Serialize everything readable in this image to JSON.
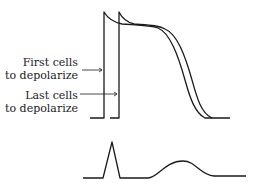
{
  "labels": {
    "first_line1": "First cells",
    "first_line2": "to depolarize",
    "last_line1": "Last cells",
    "last_line2": "to depolarize"
  },
  "colors": {
    "stroke": "#1a1a1a",
    "text": "#222222",
    "background": "#ffffff"
  }
}
